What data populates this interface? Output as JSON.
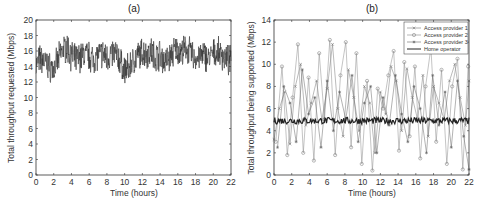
{
  "chart_data": [
    {
      "type": "line",
      "title": "(a)",
      "xlabel": "Time (hours)",
      "ylabel": "Total throughput requested (Mbps)",
      "xlim": [
        0,
        22
      ],
      "ylim": [
        0,
        20
      ],
      "xticks": [
        0,
        2,
        4,
        6,
        8,
        10,
        12,
        14,
        16,
        18,
        20,
        22
      ],
      "yticks": [
        0,
        2,
        4,
        6,
        8,
        10,
        12,
        14,
        16,
        18,
        20
      ],
      "grid": false,
      "series": [
        {
          "name": "Total throughput requested",
          "color": "#333333",
          "x": [
            0,
            0.5,
            1,
            1.5,
            2,
            2.5,
            3,
            3.5,
            4,
            4.5,
            5,
            5.5,
            6,
            6.5,
            7,
            7.5,
            8,
            8.5,
            9,
            9.5,
            10,
            10.5,
            11,
            11.5,
            12,
            12.5,
            13,
            13.5,
            14,
            14.5,
            15,
            15.5,
            16,
            16.5,
            17,
            17.5,
            18,
            18.5,
            19,
            19.5,
            20,
            20.5,
            21,
            21.5,
            22
          ],
          "values": [
            14.2,
            15.0,
            14.5,
            14.0,
            13.6,
            14.8,
            16.2,
            16.5,
            15.4,
            14.8,
            15.2,
            15.6,
            15.3,
            15.0,
            15.4,
            15.6,
            15.2,
            15.5,
            15.8,
            14.6,
            13.4,
            13.9,
            14.8,
            15.4,
            15.8,
            15.6,
            16.0,
            15.2,
            15.6,
            14.6,
            15.0,
            15.9,
            16.2,
            15.8,
            16.4,
            15.6,
            15.0,
            15.2,
            15.5,
            15.0,
            15.6,
            15.8,
            15.4,
            15.0,
            14.6
          ],
          "range_min": 11.0,
          "range_max": 19.2
        }
      ]
    },
    {
      "type": "line",
      "title": "(b)",
      "xlabel": "Time (hours)",
      "ylabel": "Total throughput being supported (Mbps)",
      "xlim": [
        0,
        22
      ],
      "ylim": [
        0,
        14
      ],
      "xticks": [
        0,
        2,
        4,
        6,
        8,
        10,
        12,
        14,
        16,
        18,
        20,
        22
      ],
      "yticks": [
        0,
        2,
        4,
        6,
        8,
        10,
        12,
        14
      ],
      "grid": false,
      "legend_position": "upper right",
      "series": [
        {
          "name": "Access provider 1",
          "marker": "x",
          "color": "#777777",
          "x": [
            0,
            0.6,
            1.2,
            1.8,
            2.4,
            3.0,
            3.6,
            4.2,
            4.8,
            5.4,
            6.0,
            6.6,
            7.2,
            7.8,
            8.4,
            9.0,
            9.6,
            10.2,
            10.8,
            11.4,
            12.0,
            12.6,
            13.2,
            13.8,
            14.4,
            15.0,
            15.6,
            16.2,
            16.8,
            17.4,
            18.0,
            18.6,
            19.2,
            19.8,
            20.4,
            21.0,
            21.6,
            22
          ],
          "values": [
            3.2,
            6.0,
            7.5,
            2.8,
            8.0,
            10.0,
            4.5,
            6.5,
            8.5,
            5.0,
            7.8,
            11.8,
            6.0,
            3.5,
            9.5,
            7.0,
            4.0,
            8.0,
            6.5,
            2.0,
            7.5,
            5.5,
            9.8,
            8.5,
            4.0,
            9.6,
            7.0,
            5.0,
            9.0,
            3.5,
            8.0,
            6.5,
            5.0,
            8.5,
            10.0,
            7.0,
            4.5,
            8.5
          ]
        },
        {
          "name": "Access provider 2",
          "marker": "o",
          "color": "#888888",
          "x": [
            0.2,
            0.9,
            1.5,
            2.1,
            2.7,
            3.3,
            3.9,
            4.5,
            5.1,
            5.7,
            6.3,
            6.9,
            7.5,
            8.1,
            8.7,
            9.3,
            9.9,
            10.5,
            11.1,
            11.7,
            12.3,
            12.9,
            13.5,
            14.1,
            14.7,
            15.3,
            15.9,
            16.5,
            17.1,
            17.7,
            18.3,
            18.9,
            19.5,
            20.1,
            20.7,
            21.3,
            21.9
          ],
          "values": [
            3.0,
            9.8,
            1.8,
            7.0,
            11.8,
            2.0,
            8.8,
            1.3,
            11.0,
            5.0,
            12.2,
            1.8,
            9.0,
            12.0,
            2.5,
            11.0,
            1.0,
            8.5,
            0.4,
            7.8,
            6.0,
            9.0,
            11.2,
            2.2,
            10.2,
            3.5,
            9.8,
            1.5,
            8.0,
            11.5,
            3.0,
            9.5,
            1.0,
            8.0,
            10.5,
            0.5,
            9.8
          ]
        },
        {
          "name": "Access provider 3",
          "marker": "*",
          "color": "#666666",
          "x": [
            0.4,
            1.1,
            1.8,
            2.5,
            3.2,
            3.9,
            4.6,
            5.3,
            6.0,
            6.7,
            7.4,
            8.1,
            8.8,
            9.5,
            10.2,
            10.9,
            11.6,
            12.3,
            13.0,
            13.7,
            14.4,
            15.1,
            15.8,
            16.5,
            17.2,
            17.9,
            18.6,
            19.3,
            20.0,
            20.7,
            21.4,
            22
          ],
          "values": [
            2.5,
            8.0,
            6.5,
            3.0,
            9.5,
            5.5,
            7.0,
            2.5,
            8.5,
            4.0,
            7.5,
            5.0,
            9.0,
            3.0,
            6.5,
            8.0,
            2.0,
            7.0,
            4.5,
            9.0,
            5.5,
            3.0,
            8.0,
            6.0,
            2.0,
            9.0,
            4.5,
            7.5,
            2.5,
            8.5,
            3.5,
            0.5
          ]
        },
        {
          "name": "Home operator",
          "marker": "none",
          "color": "#222222",
          "x": [
            0,
            22
          ],
          "values": [
            4.9,
            4.9
          ],
          "jitter": 0.3
        }
      ]
    }
  ]
}
